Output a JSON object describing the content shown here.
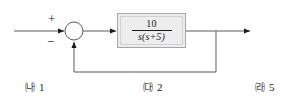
{
  "diagram": {
    "type": "control-system-block-diagram",
    "summing_junction": {
      "name": "summing-junction",
      "input_sign": "+",
      "feedback_sign": "−"
    },
    "blocks": [
      {
        "name": "transfer-function-block",
        "numerator": "10",
        "denominator": "s(s+5)",
        "expression": "10 / (s(s+5))",
        "fill_color": "#ededed",
        "border_color": "#a6a6a6"
      }
    ],
    "signals": [
      {
        "name": "input-signal",
        "label": ""
      },
      {
        "name": "error-signal",
        "label": ""
      },
      {
        "name": "output-signal",
        "label": ""
      },
      {
        "name": "feedback-signal",
        "label": ""
      }
    ],
    "line_color": "#5a5a5a",
    "arrow_color": "#1a1a1a"
  },
  "choices": [
    {
      "marker": "㈏",
      "value": "1"
    },
    {
      "marker": "㈐",
      "value": "2"
    },
    {
      "marker": "㈑",
      "value": "5"
    }
  ]
}
